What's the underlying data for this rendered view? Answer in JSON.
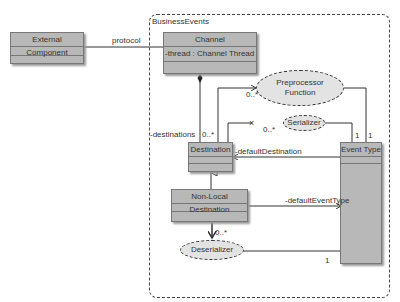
{
  "package": {
    "label": "BusinessEvents"
  },
  "classes": {
    "external_component": {
      "name": "External Component"
    },
    "channel": {
      "name": "Channel",
      "attribute": "-thread : Channel Thread [1..*]"
    },
    "destination": {
      "name": "Destination"
    },
    "non_local_destination": {
      "name": "Non-Local Destination"
    },
    "event_type": {
      "name": "Event Type"
    }
  },
  "ellipses": {
    "preprocessor": {
      "line1": "Preprocessor",
      "line2": "Function"
    },
    "serializer": {
      "label": "Serializer"
    },
    "deserializer": {
      "label": "Deserializer"
    }
  },
  "edges": {
    "protocol": "protocol",
    "destinations_role": "-destinations",
    "destinations_mult": "0..*",
    "preprocessor_mult": "0..*",
    "serializer_mult": "0..*",
    "event_serializer_mult": "1",
    "event_preprocessor_mult": "1",
    "default_destination": "-defaultDestination",
    "default_event_type": "-defaultEventType",
    "deserializer_mult": "0..*",
    "event_deserializer_mult": "1"
  }
}
